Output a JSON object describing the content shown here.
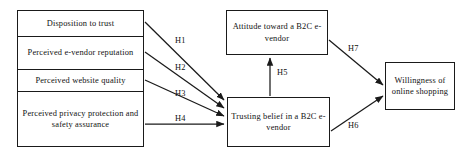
{
  "figure": {
    "type": "research-model-path-diagram",
    "canvas": {
      "width": 473,
      "height": 155
    },
    "stroke_color": "#1a1a1a",
    "text_color": "#111111",
    "background_color": "#ffffff"
  },
  "antecedents": {
    "items": [
      {
        "id": "disposition",
        "label": "Disposition to trust"
      },
      {
        "id": "reputation",
        "label": "Perceived e-vendor reputation"
      },
      {
        "id": "website_quality",
        "label": "Perceived website quality"
      },
      {
        "id": "privacy",
        "label": "Perceived privacy protection and safety assurance"
      }
    ]
  },
  "constructs": {
    "attitude": {
      "label": "Attitude toward a B2C e-vendor"
    },
    "trusting_belief": {
      "label": "Trusting belief in a B2C e-vendor"
    },
    "willingness": {
      "label": "Willingness of online shopping"
    }
  },
  "hypotheses": [
    {
      "id": "H1",
      "label": "H1",
      "from": "disposition",
      "to": "trusting_belief"
    },
    {
      "id": "H2",
      "label": "H2",
      "from": "reputation",
      "to": "trusting_belief"
    },
    {
      "id": "H3",
      "label": "H3",
      "from": "website_quality",
      "to": "trusting_belief"
    },
    {
      "id": "H4",
      "label": "H4",
      "from": "privacy",
      "to": "trusting_belief"
    },
    {
      "id": "H5",
      "label": "H5",
      "from": "trusting_belief",
      "to": "attitude"
    },
    {
      "id": "H6",
      "label": "H6",
      "from": "trusting_belief",
      "to": "willingness"
    },
    {
      "id": "H7",
      "label": "H7",
      "from": "attitude",
      "to": "willingness"
    }
  ]
}
